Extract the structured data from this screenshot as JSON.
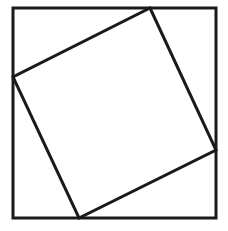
{
  "diagram": {
    "stroke_color": "#1a1a1a",
    "background_color": "#ffffff",
    "stroke_width": 3,
    "outer_square": {
      "x": 13,
      "y": 8,
      "width": 203,
      "height": 210
    },
    "inner_square": {
      "points": [
        [
          150,
          8
        ],
        [
          216,
          150
        ],
        [
          79,
          218
        ],
        [
          13,
          77
        ]
      ]
    }
  }
}
